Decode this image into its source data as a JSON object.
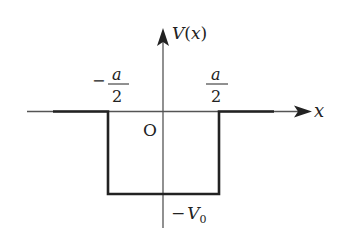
{
  "diagram": {
    "y_axis_label": "V(x)",
    "y_axis_label_var": "V",
    "y_axis_label_arg": "x",
    "x_axis_label": "x",
    "origin_label": "O",
    "left_edge_label": {
      "sign": "−",
      "numerator": "a",
      "denominator": "2"
    },
    "right_edge_label": {
      "numerator": "a",
      "denominator": "2"
    },
    "depth_label": {
      "sign": "−",
      "var": "V",
      "subscript": "0"
    },
    "colors": {
      "line": "#222222",
      "axis": "#555555",
      "background": "#ffffff"
    }
  }
}
